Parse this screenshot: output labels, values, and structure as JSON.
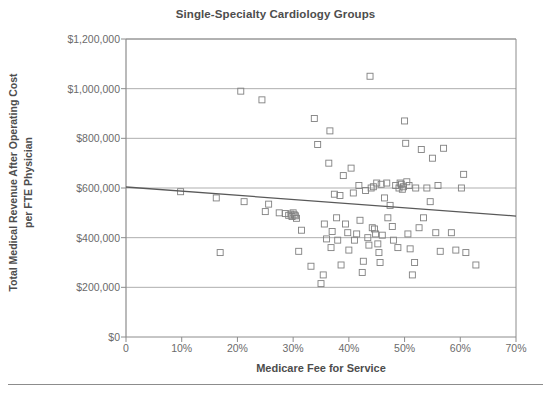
{
  "chart_data": {
    "type": "scatter",
    "title": "Single-Specialty Cardiology Groups",
    "xlabel": "Medicare Fee for Service",
    "ylabel": "Total Medical Revenue After Operating Cost per FTE Physician",
    "ylabel_line1": "Total Medical Revenue After Operating Cost",
    "ylabel_line2": "per FTE Physician",
    "xlim": [
      0,
      70
    ],
    "ylim": [
      0,
      1200000
    ],
    "xticks": [
      0,
      10,
      20,
      30,
      40,
      50,
      60,
      70
    ],
    "xtick_labels": [
      "0",
      "10%",
      "20%",
      "30%",
      "40%",
      "50%",
      "60%",
      "70%"
    ],
    "yticks": [
      0,
      200000,
      400000,
      600000,
      800000,
      1000000,
      1200000
    ],
    "ytick_labels": [
      "$0",
      "$200,000",
      "$400,000",
      "$600,000",
      "$800,000",
      "$1,000,000",
      "$1,200,000"
    ],
    "grid": "horizontal",
    "legend": "none",
    "marker": "open-square",
    "marker_color": "#808080",
    "series": [
      {
        "name": "Cardiology groups",
        "x": [
          9.8,
          16.2,
          16.9,
          20.6,
          21.2,
          24.4,
          25.0,
          25.6,
          27.5,
          28.6,
          29.2,
          29.6,
          29.8,
          30.0,
          30.2,
          30.4,
          30.6,
          31.0,
          31.5,
          33.2,
          33.8,
          34.4,
          35.0,
          35.4,
          35.6,
          36.0,
          36.4,
          36.6,
          36.8,
          37.0,
          37.4,
          37.8,
          38.0,
          38.4,
          38.6,
          39.0,
          39.4,
          39.8,
          40.0,
          40.4,
          40.8,
          41.0,
          41.4,
          41.8,
          42.0,
          42.4,
          42.6,
          43.0,
          43.4,
          43.6,
          43.8,
          44.0,
          44.2,
          44.4,
          44.6,
          44.8,
          45.0,
          45.2,
          45.4,
          45.6,
          45.8,
          46.0,
          46.4,
          46.8,
          47.0,
          47.4,
          47.8,
          48.0,
          48.4,
          48.8,
          49.0,
          49.2,
          49.4,
          49.6,
          49.8,
          50.0,
          50.2,
          50.4,
          50.6,
          50.8,
          51.0,
          51.4,
          51.8,
          52.0,
          52.6,
          53.0,
          53.4,
          54.0,
          54.6,
          55.0,
          55.6,
          56.0,
          56.4,
          57.0,
          58.4,
          59.2,
          60.2,
          60.6,
          61.0,
          62.8
        ],
        "y": [
          585000,
          560000,
          340000,
          990000,
          545000,
          955000,
          505000,
          535000,
          500000,
          497000,
          490000,
          495000,
          485000,
          500000,
          492000,
          488000,
          478000,
          345000,
          430000,
          285000,
          880000,
          775000,
          215000,
          250000,
          455000,
          395000,
          700000,
          830000,
          360000,
          425000,
          575000,
          480000,
          390000,
          570000,
          290000,
          650000,
          455000,
          420000,
          350000,
          680000,
          580000,
          390000,
          415000,
          610000,
          470000,
          260000,
          305000,
          590000,
          400000,
          370000,
          1050000,
          600000,
          440000,
          605000,
          435000,
          415000,
          620000,
          375000,
          340000,
          300000,
          615000,
          410000,
          560000,
          620000,
          480000,
          530000,
          445000,
          390000,
          610000,
          360000,
          600000,
          620000,
          615000,
          595000,
          605000,
          870000,
          780000,
          625000,
          415000,
          610000,
          355000,
          250000,
          300000,
          600000,
          440000,
          755000,
          480000,
          600000,
          545000,
          720000,
          420000,
          610000,
          345000,
          760000,
          420000,
          350000,
          600000,
          655000,
          340000,
          290000
        ]
      }
    ],
    "trendline": {
      "name": "Linear trend",
      "x": [
        0,
        70
      ],
      "y": [
        604000,
        487000
      ],
      "color": "#595959"
    }
  },
  "footer": {
    "rule": true
  }
}
